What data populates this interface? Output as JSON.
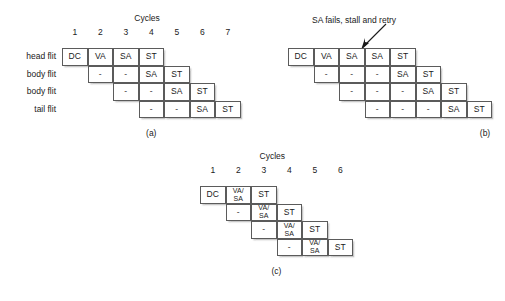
{
  "figure": {
    "cycles_header": "Cycles",
    "dash": "-"
  },
  "panel_a": {
    "caption": "(a)",
    "cycles_header": "Cycles",
    "cycle_numbers": [
      "1",
      "2",
      "3",
      "4",
      "5",
      "6",
      "7"
    ],
    "row_labels": [
      "head flit",
      "body flit",
      "body flit",
      "tail flit"
    ],
    "rows": [
      {
        "start_col": 1,
        "cells": [
          "DC",
          "VA",
          "SA",
          "ST"
        ]
      },
      {
        "start_col": 2,
        "cells": [
          "-",
          "-",
          "SA",
          "ST"
        ]
      },
      {
        "start_col": 3,
        "cells": [
          "-",
          "-",
          "SA",
          "ST"
        ]
      },
      {
        "start_col": 4,
        "cells": [
          "-",
          "-",
          "SA",
          "ST"
        ]
      }
    ]
  },
  "panel_b": {
    "caption": "(b)",
    "annotation": "SA fails, stall and retry",
    "rows": [
      {
        "start_col": 1,
        "cells": [
          "DC",
          "VA",
          "SA",
          "SA",
          "ST"
        ]
      },
      {
        "start_col": 2,
        "cells": [
          "-",
          "-",
          "-",
          "SA",
          "ST"
        ]
      },
      {
        "start_col": 3,
        "cells": [
          "-",
          "-",
          "-",
          "SA",
          "ST"
        ]
      },
      {
        "start_col": 4,
        "cells": [
          "-",
          "-",
          "-",
          "SA",
          "ST"
        ]
      }
    ]
  },
  "panel_c": {
    "caption": "(c)",
    "cycles_header": "Cycles",
    "cycle_numbers": [
      "1",
      "2",
      "3",
      "4",
      "5",
      "6"
    ],
    "rows": [
      {
        "start_col": 1,
        "cells": [
          "DC",
          "VA/\nSA",
          "ST"
        ]
      },
      {
        "start_col": 2,
        "cells": [
          "-",
          "VA/\nSA",
          "ST"
        ]
      },
      {
        "start_col": 3,
        "cells": [
          "-",
          "VA/\nSA",
          "ST"
        ]
      },
      {
        "start_col": 4,
        "cells": [
          "-",
          "VA/\nSA",
          "ST"
        ]
      }
    ]
  },
  "colors": {
    "cell_border": "#5b5b5b",
    "text": "#1a1a1a",
    "background": "#ffffff"
  }
}
